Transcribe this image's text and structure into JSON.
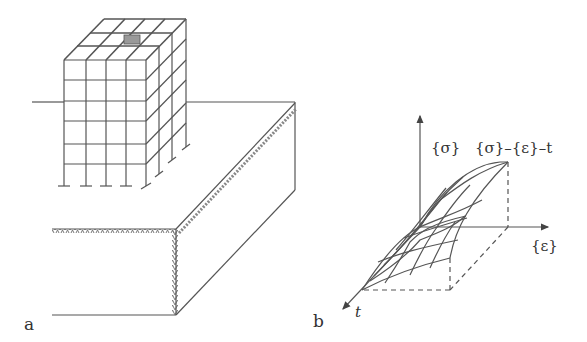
{
  "figure": {
    "panels": [
      {
        "id": "a",
        "label": "a",
        "description": "3D building frame (4x5 bay grid, 5 storeys) next to an excavation pit with retaining-wall hatching"
      },
      {
        "id": "b",
        "label": "b",
        "description": "3D stress-strain-time surface"
      }
    ],
    "panel_b": {
      "y_axis_label": "{σ}",
      "x_axis_label": "{ε}",
      "z_axis_label": "t",
      "surface_label": "{σ}–{ε}–t"
    },
    "colors": {
      "line": "#555555",
      "hatch": "#777777",
      "background": "#ffffff"
    }
  }
}
